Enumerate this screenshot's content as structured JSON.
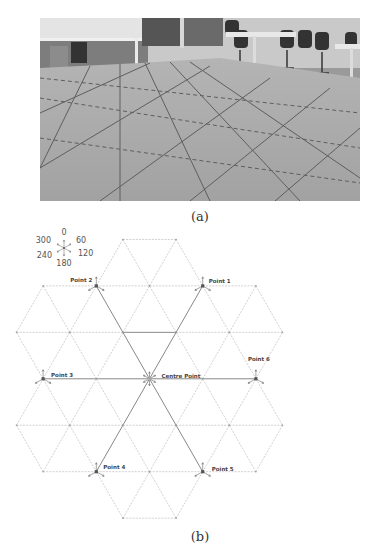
{
  "figure": {
    "panel_a": {
      "caption": "(a)",
      "description": "Photograph of office floor with triangular grid of taped lines; desks and office chairs in background"
    },
    "panel_b": {
      "caption": "(b)",
      "compass": {
        "labels": [
          {
            "text": "0",
            "angle": 0
          },
          {
            "text": "60",
            "angle": 60
          },
          {
            "text": "120",
            "angle": 120
          },
          {
            "text": "180",
            "angle": 180
          },
          {
            "text": "240",
            "angle": 240
          },
          {
            "text": "300",
            "angle": 300
          }
        ]
      },
      "points": [
        {
          "id": "point-1",
          "label": "Point 1",
          "row": 1,
          "col": 3
        },
        {
          "id": "point-2",
          "label": "Point 2",
          "row": 1,
          "col": 1
        },
        {
          "id": "point-3",
          "label": "Point 3",
          "row": 3,
          "col": 0
        },
        {
          "id": "centre-point",
          "label": "Centre Point",
          "row": 3,
          "col": 2
        },
        {
          "id": "point-4",
          "label": "Point 4",
          "row": 5,
          "col": 1
        },
        {
          "id": "point-5",
          "label": "Point 5",
          "row": 5,
          "col": 3
        },
        {
          "id": "point-6",
          "label": "Point 6",
          "row": 3,
          "col": 4
        }
      ]
    }
  },
  "colors": {
    "grid_dashed": "#b0b0b0",
    "grid_solid": "#7a7a7a",
    "label": "#444444",
    "photo_floor": "#a8a8a8",
    "photo_wall": "#c8c8c8"
  }
}
